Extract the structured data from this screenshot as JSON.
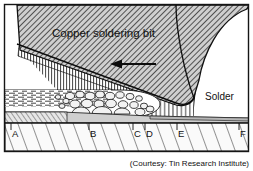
{
  "figure": {
    "width": 253,
    "height": 171,
    "background": "#ffffff",
    "frame_color": "#1a1a1a"
  },
  "labels": {
    "copper_bit": "Copper soldering bit",
    "solder": "Solder",
    "credit": "(Courtesy: Tin Research Institute)"
  },
  "zone_markers": [
    {
      "id": "A",
      "label": "A",
      "x": 12,
      "y": 133
    },
    {
      "id": "B",
      "label": "B",
      "x": 90,
      "y": 133
    },
    {
      "id": "C",
      "label": "C",
      "x": 134,
      "y": 133
    },
    {
      "id": "D",
      "label": "D",
      "x": 146,
      "y": 133
    },
    {
      "id": "E",
      "label": "E",
      "x": 178,
      "y": 133
    },
    {
      "id": "F",
      "label": "F",
      "x": 240,
      "y": 133
    }
  ],
  "colors": {
    "copper_fill": "#c9c9c9",
    "copper_hatch": "#2e2e2e",
    "solder_fill": "#ffffff",
    "solder_hatch": "#333333",
    "substrate_fill": "#f7f7f7",
    "substrate_hatch": "#333333",
    "intermetallic_fill": "#d8d8d8",
    "outline": "#121212"
  },
  "annotations": {
    "arrow_direction": "left",
    "arrow_meaning": "direction of bit travel"
  }
}
